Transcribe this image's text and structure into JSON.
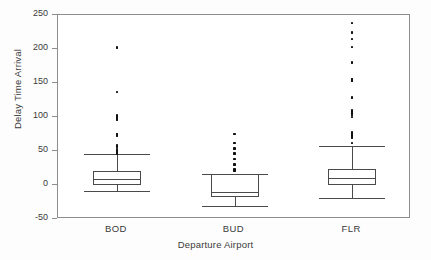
{
  "chart_data": {
    "type": "box",
    "title": "",
    "xlabel": "Departure Airport",
    "ylabel": "Delay Time Arrival",
    "categories": [
      "BOD",
      "BUD",
      "FLR"
    ],
    "ylim": [
      -50,
      250
    ],
    "yticks": [
      250,
      200,
      150,
      100,
      50,
      0,
      -50
    ],
    "ytick_labels": [
      "250",
      "200",
      "150",
      "100",
      "50",
      "0",
      "-50"
    ],
    "grid": false,
    "legend": null,
    "boxes": [
      {
        "name": "BOD",
        "whisker_low": -9,
        "q1": 0,
        "median": 9,
        "q3": 20,
        "whisker_high": 45,
        "outliers": [
          46,
          47,
          48,
          49,
          50,
          51,
          53,
          57,
          58,
          72,
          74,
          75,
          96,
          99,
          102,
          137,
          202
        ]
      },
      {
        "name": "BUD",
        "whisker_low": -31,
        "q1": -18,
        "median": -10,
        "q3": 16,
        "whisker_high": 16,
        "outliers": [
          21,
          23,
          30,
          38,
          46,
          54,
          62,
          75
        ]
      },
      {
        "name": "FLR",
        "whisker_low": -19,
        "q1": 0,
        "median": 11,
        "q3": 24,
        "whisker_high": 57,
        "outliers": [
          62,
          70,
          71,
          72,
          73,
          74,
          75,
          76,
          77,
          100,
          103,
          105,
          107,
          108,
          110,
          129,
          153,
          154,
          155,
          156,
          180,
          203,
          215,
          224,
          238
        ]
      }
    ]
  }
}
